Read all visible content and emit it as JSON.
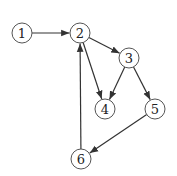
{
  "diagram": {
    "type": "directed-graph",
    "node_radius": 10,
    "nodes": [
      {
        "id": "1",
        "label": "1",
        "x": 22,
        "y": 33
      },
      {
        "id": "2",
        "label": "2",
        "x": 80,
        "y": 33
      },
      {
        "id": "3",
        "label": "3",
        "x": 129,
        "y": 58
      },
      {
        "id": "4",
        "label": "4",
        "x": 105,
        "y": 109
      },
      {
        "id": "5",
        "label": "5",
        "x": 155,
        "y": 109
      },
      {
        "id": "6",
        "label": "6",
        "x": 81,
        "y": 159
      }
    ],
    "edges": [
      {
        "from": "1",
        "to": "2"
      },
      {
        "from": "2",
        "to": "3"
      },
      {
        "from": "2",
        "to": "4"
      },
      {
        "from": "3",
        "to": "4"
      },
      {
        "from": "3",
        "to": "5"
      },
      {
        "from": "5",
        "to": "6"
      },
      {
        "from": "6",
        "to": "2"
      }
    ],
    "colors": {
      "edge": "#333333",
      "node_stroke": "#555555",
      "node_fill": "#ffffff",
      "label": "#222222"
    }
  }
}
